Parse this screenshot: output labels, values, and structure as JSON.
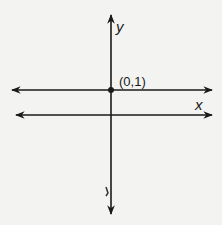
{
  "figure": {
    "type": "coordinate-plane",
    "axes": {
      "x_label": "x",
      "y_label": "y"
    },
    "lines": [
      {
        "name": "horizontal-line-y-equals-1",
        "equation": "y = 1",
        "arrows": "both"
      }
    ],
    "points": [
      {
        "label": "(0,1)",
        "x": 0,
        "y": 1
      }
    ],
    "colors": {
      "ink": "#1a1a1a",
      "background": "#f3f3f1"
    }
  }
}
